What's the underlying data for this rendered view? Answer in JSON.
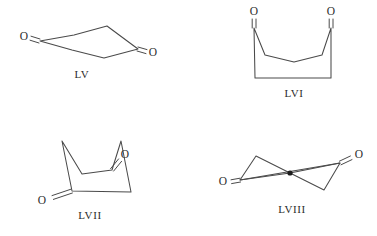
{
  "figure": {
    "kind": "chemical-structure-plate",
    "background_color": "#ffffff",
    "line_color": "#4a4a4a",
    "text_color": "#2b2b2b",
    "width": 377,
    "height": 236,
    "structures": [
      {
        "id": "LV",
        "label": "LV",
        "description": "cyclohexane-1,4-dione chair conformation",
        "label_position": {
          "x": 82,
          "y": 75
        },
        "oxygen_labels": [
          {
            "text": "O",
            "x": 24,
            "y": 37
          },
          {
            "text": "O",
            "x": 153,
            "y": 53
          }
        ],
        "ring_vertices": [
          {
            "x": 40,
            "y": 41
          },
          {
            "x": 72,
            "y": 50
          },
          {
            "x": 104,
            "y": 58
          },
          {
            "x": 138,
            "y": 49
          },
          {
            "x": 107,
            "y": 26
          },
          {
            "x": 74,
            "y": 35
          }
        ],
        "ring_path": "M40,41 L72,50 L104,58 L138,49 L107,26 L74,35 Z",
        "double_bonds": [
          {
            "from": {
              "x": 40,
              "y": 41
            },
            "to": {
              "x": 30,
              "y": 38
            }
          },
          {
            "from": {
              "x": 138,
              "y": 49
            },
            "to": {
              "x": 148,
              "y": 52
            }
          }
        ]
      },
      {
        "id": "LVI",
        "label": "LVI",
        "description": "cyclohexane-1,4-dione boat conformation, both carbonyls up",
        "label_position": {
          "x": 294,
          "y": 94
        },
        "oxygen_labels": [
          {
            "text": "O",
            "x": 254,
            "y": 12
          },
          {
            "text": "O",
            "x": 330,
            "y": 12
          }
        ],
        "ring_vertices": [
          {
            "x": 254,
            "y": 28
          },
          {
            "x": 265,
            "y": 55
          },
          {
            "x": 294,
            "y": 62
          },
          {
            "x": 322,
            "y": 55
          },
          {
            "x": 331,
            "y": 28
          },
          {
            "x": 331,
            "y": 78
          },
          {
            "x": 255,
            "y": 78
          }
        ],
        "ring_path": "M254,28 L265,55 L294,62 L322,55 L331,28 L331,78 L255,78 Z",
        "double_bonds": [
          {
            "from": {
              "x": 254,
              "y": 28
            },
            "to": {
              "x": 254,
              "y": 19
            }
          },
          {
            "from": {
              "x": 331,
              "y": 28
            },
            "to": {
              "x": 331,
              "y": 19
            }
          }
        ]
      },
      {
        "id": "LVII",
        "label": "LVII",
        "description": "cyclohexane-1,4-dione twist-boat conformation",
        "label_position": {
          "x": 90,
          "y": 216
        },
        "oxygen_labels": [
          {
            "text": "O",
            "x": 42,
            "y": 200
          },
          {
            "text": "O",
            "x": 124,
            "y": 165
          }
        ],
        "ring_vertices": [
          {
            "x": 62,
            "y": 141
          },
          {
            "x": 72,
            "y": 191
          },
          {
            "x": 131,
            "y": 192
          },
          {
            "x": 121,
            "y": 141
          },
          {
            "x": 112,
            "y": 170
          },
          {
            "x": 82,
            "y": 174
          }
        ],
        "ring_path": "M62,141 L72,191 L131,192 L121,141 L112,170 L82,174 Z",
        "double_bonds": [
          {
            "from": {
              "x": 72,
              "y": 191
            },
            "to": {
              "x": 52,
              "y": 198
            }
          },
          {
            "from": {
              "x": 112,
              "y": 170
            },
            "to": {
              "x": 120,
              "y": 160
            }
          }
        ]
      },
      {
        "id": "LVIII",
        "label": "LVIII",
        "description": "cyclohexane-1,4-dione twist conformation with central point marked",
        "label_position": {
          "x": 292,
          "y": 210
        },
        "oxygen_labels": [
          {
            "text": "O",
            "x": 223,
            "y": 182
          },
          {
            "text": "O",
            "x": 359,
            "y": 156
          }
        ],
        "ring_vertices": [
          {
            "x": 240,
            "y": 180
          },
          {
            "x": 256,
            "y": 156
          },
          {
            "x": 290,
            "y": 173
          },
          {
            "x": 340,
            "y": 163
          },
          {
            "x": 324,
            "y": 190
          },
          {
            "x": 290,
            "y": 173
          }
        ],
        "ring_path": "M240,180 L256,156 L290,173 L340,163 L324,190 L290,173 Z",
        "long_bonds": [
          {
            "from": {
              "x": 240,
              "y": 180
            },
            "to": {
              "x": 340,
              "y": 163
            }
          }
        ],
        "double_bonds": [
          {
            "from": {
              "x": 240,
              "y": 180
            },
            "to": {
              "x": 231,
              "y": 182
            }
          },
          {
            "from": {
              "x": 340,
              "y": 163
            },
            "to": {
              "x": 351,
              "y": 158
            }
          }
        ],
        "center_marker": {
          "x": 290,
          "y": 173,
          "r": 2.6
        }
      }
    ]
  }
}
